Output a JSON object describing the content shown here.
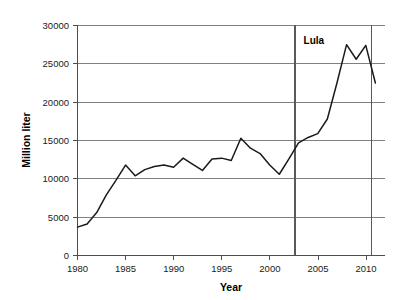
{
  "chart_data": {
    "type": "line",
    "title": "",
    "xlabel": "Year",
    "ylabel": "Million liter",
    "xlim": [
      1980,
      2012
    ],
    "ylim": [
      0,
      30000
    ],
    "xticks": [
      1980,
      1985,
      1990,
      1995,
      2000,
      2005,
      2010
    ],
    "yticks": [
      0,
      5000,
      10000,
      15000,
      20000,
      25000,
      30000
    ],
    "xtick_labels": [
      "1980",
      "1985",
      "1990",
      "1995",
      "2000",
      "2005",
      "2010"
    ],
    "ytick_labels": [
      "0",
      "5000",
      "10000",
      "15000",
      "20000",
      "25000",
      "30000"
    ],
    "grid": "horizontal",
    "legend": "none",
    "series": [
      {
        "name": "Ethanol production",
        "color": "#1a1a1a",
        "x": [
          1980,
          1981,
          1982,
          1983,
          1984,
          1985,
          1986,
          1987,
          1988,
          1989,
          1990,
          1991,
          1992,
          1993,
          1994,
          1995,
          1996,
          1997,
          1998,
          1999,
          2000,
          2001,
          2002,
          2003,
          2004,
          2005,
          2006,
          2007,
          2008,
          2009,
          2010,
          2011
        ],
        "values": [
          3700,
          4100,
          5600,
          7900,
          9800,
          11800,
          10400,
          11200,
          11600,
          11800,
          11500,
          12700,
          11900,
          11100,
          12600,
          12700,
          12400,
          15300,
          14000,
          13300,
          11800,
          10600,
          12600,
          14700,
          15400,
          15900,
          17800,
          22500,
          27500,
          25600,
          27400,
          22500
        ]
      }
    ],
    "annotations": [
      {
        "name": "lula-period-start",
        "type": "vline",
        "x": 2002.6,
        "label": ""
      },
      {
        "name": "lula-period-end",
        "type": "vline",
        "x": 2010.6,
        "label": ""
      },
      {
        "name": "lula-label",
        "type": "text",
        "x": 2004.6,
        "y": 27600,
        "label": "Lula"
      }
    ]
  }
}
